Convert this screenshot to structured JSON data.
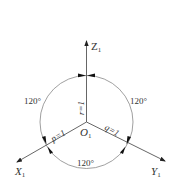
{
  "diagram": {
    "type": "isometric-axes",
    "center": {
      "label": "O",
      "subscript": "1"
    },
    "axes": [
      {
        "id": "z",
        "label": "Z",
        "subscript": "1",
        "coefficient_label": "r=1"
      },
      {
        "id": "x",
        "label": "X",
        "subscript": "1",
        "coefficient_label": "p=1"
      },
      {
        "id": "y",
        "label": "Y",
        "subscript": "1",
        "coefficient_label": "q=1"
      }
    ],
    "angles": {
      "left": "120°",
      "right": "120°",
      "bottom": "120°"
    },
    "colors": {
      "line": "#555555",
      "circle": "#888888",
      "text": "#333333"
    }
  }
}
